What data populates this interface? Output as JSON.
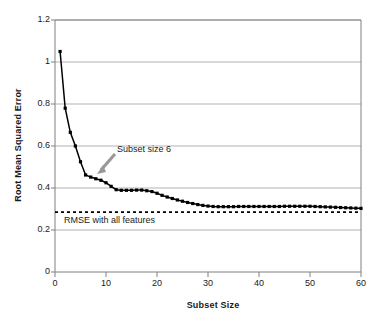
{
  "chart_data": {
    "type": "line",
    "title": "",
    "xlabel": "Subset Size",
    "ylabel": "Root Mean Squared Error",
    "xlim": [
      0,
      60
    ],
    "ylim": [
      0,
      1.2
    ],
    "xticks": [
      0,
      10,
      20,
      30,
      40,
      50,
      60
    ],
    "yticks": [
      0,
      0.2,
      0.4,
      0.6,
      0.8,
      1,
      1.2
    ],
    "xtick_labels": [
      "0",
      "10",
      "20",
      "30",
      "40",
      "50",
      "60"
    ],
    "ytick_labels": [
      "0",
      "0.2",
      "0.4",
      "0.6",
      "0.8",
      "1",
      "1.2"
    ],
    "grid": "horizontal",
    "legend": "none",
    "series": [
      {
        "name": "RMSE by subset size",
        "marker": "square",
        "color": "#000000",
        "x": [
          1,
          2,
          3,
          4,
          5,
          6,
          7,
          8,
          9,
          10,
          11,
          12,
          13,
          14,
          15,
          16,
          17,
          18,
          19,
          20,
          21,
          22,
          23,
          24,
          25,
          26,
          27,
          28,
          29,
          30,
          31,
          32,
          33,
          34,
          35,
          36,
          37,
          38,
          39,
          40,
          41,
          42,
          43,
          44,
          45,
          46,
          47,
          48,
          49,
          50,
          51,
          52,
          53,
          54,
          55,
          56,
          57,
          58,
          59,
          60
        ],
        "values": [
          1.05,
          0.78,
          0.665,
          0.6,
          0.525,
          0.462,
          0.452,
          0.444,
          0.437,
          0.425,
          0.408,
          0.392,
          0.389,
          0.389,
          0.389,
          0.39,
          0.39,
          0.387,
          0.383,
          0.375,
          0.365,
          0.357,
          0.35,
          0.343,
          0.337,
          0.331,
          0.326,
          0.321,
          0.317,
          0.314,
          0.312,
          0.311,
          0.311,
          0.311,
          0.311,
          0.312,
          0.312,
          0.312,
          0.312,
          0.312,
          0.312,
          0.312,
          0.312,
          0.312,
          0.313,
          0.313,
          0.313,
          0.313,
          0.313,
          0.313,
          0.312,
          0.311,
          0.31,
          0.309,
          0.308,
          0.307,
          0.306,
          0.305,
          0.304,
          0.303
        ]
      }
    ],
    "reference_lines": [
      {
        "name": "RMSE with all features",
        "value": 0.285,
        "orientation": "horizontal",
        "style": "dashed",
        "color": "#000000"
      }
    ],
    "annotations": [
      {
        "name": "subset-size-6",
        "text": "Subset size 6",
        "points_to_x": 6,
        "points_to_y": 0.462,
        "arrow": true,
        "arrow_color": "#999999"
      },
      {
        "name": "rmse-all-features",
        "text": "RMSE with all features",
        "value": 0.285,
        "arrow": false
      }
    ]
  },
  "axes": {
    "x_title": "Subset Size",
    "y_title": "Root Mean Squared Error"
  },
  "labels": {
    "annotation_subset": "Subset size 6",
    "annotation_rmse": "RMSE with all features"
  },
  "colors": {
    "line": "#000000",
    "grid": "#b3b3b3",
    "frame": "#808080",
    "arrow": "#999999",
    "text": "#1a1a1a",
    "background": "#ffffff"
  }
}
